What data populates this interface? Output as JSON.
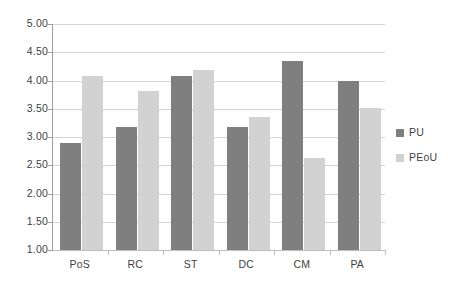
{
  "chart_data": {
    "type": "bar",
    "title": "",
    "subtitle": "",
    "xlabel": "",
    "ylabel": "",
    "categories": [
      "PoS",
      "RC",
      "ST",
      "DC",
      "CM",
      "PA"
    ],
    "series": [
      {
        "name": "PU",
        "color": "#7f7f7f",
        "values": [
          2.9,
          3.18,
          4.08,
          3.18,
          4.35,
          4.0
        ]
      },
      {
        "name": "PEoU",
        "color": "#d2d2d2",
        "values": [
          4.08,
          3.82,
          4.18,
          3.36,
          2.63,
          3.52
        ]
      }
    ],
    "ylim": [
      1.0,
      5.0
    ],
    "ytick_step": 0.5,
    "ytick_labels": [
      "5.00",
      "4.50",
      "4.00",
      "3.50",
      "3.00",
      "2.50",
      "2.00",
      "1.50",
      "1.00"
    ],
    "ytick_values": [
      5.0,
      4.5,
      4.0,
      3.5,
      3.0,
      2.5,
      2.0,
      1.5,
      1.0
    ],
    "grid": true,
    "grid_axis": "y",
    "legend": [
      "PU",
      "PEoU"
    ],
    "legend_position": "right"
  },
  "legend": {
    "items": [
      {
        "label": "PU"
      },
      {
        "label": "PEoU"
      }
    ]
  }
}
